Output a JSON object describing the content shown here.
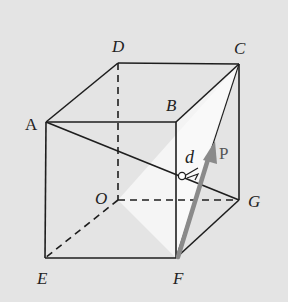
{
  "diagram": {
    "type": "cube-geometry",
    "background": "#e4e4e4",
    "line_color": "#1e1e1e",
    "arrow_color": "#8a8a8a",
    "shade_color": "#f4f4f4",
    "vertices": {
      "A": {
        "label": "A",
        "x": 46,
        "y": 122
      },
      "B": {
        "label": "B",
        "x": 176,
        "y": 122
      },
      "C": {
        "label": "C",
        "x": 239,
        "y": 64
      },
      "D": {
        "label": "D",
        "x": 118,
        "y": 63
      },
      "E": {
        "label": "E",
        "x": 45,
        "y": 258
      },
      "F": {
        "label": "F",
        "x": 176,
        "y": 258
      },
      "G": {
        "label": "G",
        "x": 239,
        "y": 200
      },
      "O": {
        "label": "O",
        "x": 118,
        "y": 200
      }
    },
    "shaded_plane": [
      "O",
      "C",
      "F"
    ],
    "segment_AG": {
      "from": "A",
      "to": "G"
    },
    "distance_label": "d",
    "vector_label": "P"
  }
}
